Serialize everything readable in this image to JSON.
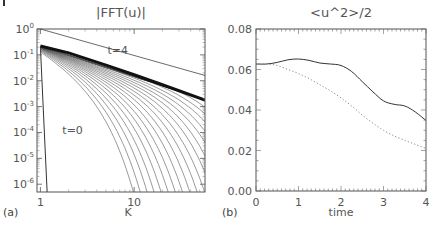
{
  "chart_data": [
    {
      "panel": "(a)",
      "type": "line",
      "title": "|FFT(u)|",
      "xlabel": "K",
      "ylabel": "",
      "xscale": "log",
      "yscale": "log",
      "xlim": [
        0.92,
        57
      ],
      "ylim": [
        5e-07,
        1
      ],
      "x_ticks": [
        {
          "value": 1,
          "label": "1"
        },
        {
          "value": 10,
          "label": "10"
        }
      ],
      "y_ticks": [
        {
          "value": 1,
          "base": "10",
          "exp": "0"
        },
        {
          "value": 0.1,
          "base": "10",
          "exp": "-1"
        },
        {
          "value": 0.01,
          "base": "10",
          "exp": "-2"
        },
        {
          "value": 0.001,
          "base": "10",
          "exp": "-3"
        },
        {
          "value": 0.0001,
          "base": "10",
          "exp": "-4"
        },
        {
          "value": 1e-05,
          "base": "10",
          "exp": "-5"
        },
        {
          "value": 1e-06,
          "base": "10",
          "exp": "-6"
        }
      ],
      "annotations": [
        {
          "text": "t=4",
          "x": 5.2,
          "y": 0.15
        },
        {
          "text": "t=0",
          "x": 1.8,
          "y": 0.00012
        }
      ],
      "reference_line": {
        "description": "power-law reference slope",
        "points": [
          [
            1,
            1
          ],
          [
            57,
            0.016
          ]
        ]
      },
      "series": [
        {
          "name": "t=0",
          "points": [
            [
              1,
              0.2
            ],
            [
              1.18,
              5e-07
            ]
          ]
        },
        {
          "name": "t=4",
          "points": [
            [
              1,
              0.22
            ],
            [
              2,
              0.12
            ],
            [
              5,
              0.04
            ],
            [
              10,
              0.017
            ],
            [
              20,
              0.007
            ],
            [
              57,
              0.0018
            ]
          ],
          "style": "thick"
        }
      ],
      "n_intermediate_curves": 24,
      "grid": false
    },
    {
      "panel": "(b)",
      "type": "line",
      "title": "<u^2>/2",
      "xlabel": "time",
      "ylabel": "",
      "xlim": [
        0,
        4
      ],
      "ylim": [
        0,
        0.08
      ],
      "x_ticks": [
        "0",
        "1",
        "2",
        "3",
        "4"
      ],
      "y_ticks": [
        "0.00",
        "0.02",
        "0.04",
        "0.06",
        "0.08"
      ],
      "grid": false,
      "series": [
        {
          "name": "solid",
          "style": "solid",
          "x": [
            0,
            0.25,
            0.5,
            0.75,
            1.0,
            1.25,
            1.5,
            1.75,
            2.0,
            2.25,
            2.5,
            2.75,
            3.0,
            3.25,
            3.5,
            3.75,
            4.0
          ],
          "y": [
            0.0627,
            0.0627,
            0.0635,
            0.0648,
            0.0652,
            0.0645,
            0.0632,
            0.0627,
            0.062,
            0.059,
            0.054,
            0.049,
            0.0445,
            0.0428,
            0.042,
            0.039,
            0.0348
          ]
        },
        {
          "name": "dotted",
          "style": "dotted",
          "x": [
            0,
            0.25,
            0.5,
            0.75,
            1.0,
            1.25,
            1.5,
            1.75,
            2.0,
            2.25,
            2.5,
            2.75,
            3.0,
            3.25,
            3.5,
            3.75,
            4.0
          ],
          "y": [
            0.0627,
            0.0627,
            0.062,
            0.06,
            0.058,
            0.0555,
            0.0525,
            0.0495,
            0.046,
            0.042,
            0.0375,
            0.0335,
            0.03,
            0.0272,
            0.025,
            0.023,
            0.021
          ]
        }
      ]
    }
  ],
  "panel_labels": {
    "a": "(a)",
    "b": "(b)"
  }
}
